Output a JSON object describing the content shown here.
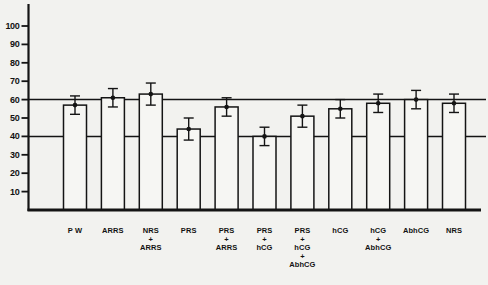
{
  "figure": {
    "background": "#f2f2ef",
    "ink": "#141414",
    "title": ""
  },
  "chart_data": {
    "type": "bar",
    "title": "",
    "xlabel": "",
    "ylabel": "",
    "categories": [
      "P W",
      "ARRS",
      "NRS + ARRS",
      "PRS",
      "PRS + ARRS",
      "PRS + hCG",
      "PRS + hCG + AbhCG",
      "hCG",
      "hCG + AbhCG",
      "AbhCG",
      "NRS"
    ],
    "category_lines": [
      [
        "P W"
      ],
      [
        "ARRS"
      ],
      [
        "NRS",
        "+",
        "ARRS"
      ],
      [
        "PRS"
      ],
      [
        "PRS",
        "+",
        "ARRS"
      ],
      [
        "PRS",
        "+",
        "hCG"
      ],
      [
        "PRS",
        "+",
        "hCG",
        "+",
        "AbhCG"
      ],
      [
        "hCG"
      ],
      [
        "hCG",
        "+",
        "AbhCG"
      ],
      [
        "AbhCG"
      ],
      [
        "NRS"
      ]
    ],
    "series": [
      {
        "name": "mean",
        "values": [
          57,
          61,
          63,
          44,
          56,
          40,
          51,
          55,
          58,
          60,
          58
        ]
      }
    ],
    "errors": [
      5,
      5,
      6,
      6,
      5,
      5,
      6,
      5,
      5,
      5,
      5
    ],
    "error_style": "caps-and-dot",
    "y_ticks": [
      10,
      20,
      30,
      40,
      50,
      60,
      70,
      80,
      90,
      100
    ],
    "ylim": [
      0,
      112
    ],
    "reference_lines": [
      60,
      40
    ],
    "grid": false,
    "legend": false,
    "bar_fill": "#f6f6f3",
    "bar_edge": "#141414"
  }
}
